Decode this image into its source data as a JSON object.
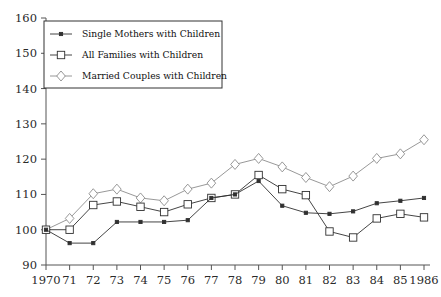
{
  "chart_data": {
    "type": "line",
    "title": "",
    "xlabel": "",
    "ylabel": "",
    "x": [
      1970,
      1971,
      1972,
      1973,
      1974,
      1975,
      1976,
      1977,
      1978,
      1979,
      1980,
      1981,
      1982,
      1983,
      1984,
      1985,
      1986
    ],
    "xtick_labels": [
      "1970",
      "71",
      "72",
      "73",
      "74",
      "75",
      "76",
      "77",
      "78",
      "79",
      "80",
      "81",
      "82",
      "83",
      "84",
      "85",
      "1986"
    ],
    "ytick_labels": [
      "90",
      "100",
      "110",
      "120",
      "130",
      "140",
      "150",
      "160"
    ],
    "ylim": [
      90,
      160
    ],
    "ytick_values": [
      90,
      100,
      110,
      120,
      130,
      140,
      150,
      160
    ],
    "grid": false,
    "legend_position": "top-left",
    "series": [
      {
        "name": "Single Mothers with Children",
        "marker": "filled-dot",
        "color": "#303030",
        "values": [
          100.0,
          96.2,
          96.2,
          102.2,
          102.2,
          102.2,
          102.7,
          109.0,
          110.0,
          113.8,
          106.8,
          104.8,
          104.5,
          105.2,
          107.5,
          108.2,
          109.0
        ]
      },
      {
        "name": "All Families with Children",
        "marker": "open-square",
        "color": "#303030",
        "values": [
          100.0,
          100.0,
          107.0,
          108.0,
          106.5,
          105.0,
          107.2,
          109.0,
          110.0,
          115.5,
          111.5,
          109.8,
          99.5,
          97.8,
          103.2,
          104.5,
          103.5
        ]
      },
      {
        "name": "Married Couples with Children",
        "marker": "open-diamond",
        "color": "#8c8c8c",
        "values": [
          100.0,
          103.2,
          110.2,
          111.5,
          109.0,
          108.2,
          111.5,
          113.2,
          118.5,
          120.2,
          117.8,
          114.8,
          112.2,
          115.2,
          120.2,
          121.5,
          125.5
        ]
      }
    ]
  }
}
